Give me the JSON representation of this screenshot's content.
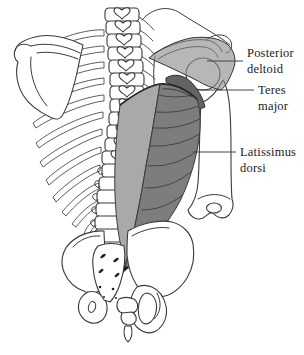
{
  "labels": [
    {
      "id": "posterior-deltoid",
      "line1": "Posterior",
      "line2": "deltoid"
    },
    {
      "id": "teres-major",
      "line1": "Teres",
      "line2": "major"
    },
    {
      "id": "latissimus-dorsi",
      "line1": "Latissimus",
      "line2": "dorsi"
    }
  ],
  "colors": {
    "background": "#ffffff",
    "outline": "#3a3a3a",
    "deltoid": "#8a8a8a",
    "teres": "#636363",
    "lat_light": "#a9a9a9",
    "lat_dark": "#7d7d7d",
    "fiber_line": "#454545",
    "label_text": "#1c1c1c"
  }
}
